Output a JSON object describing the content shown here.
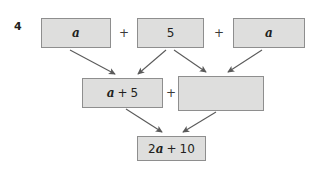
{
  "question": {
    "number": "4"
  },
  "diagram": {
    "type": "expression-pyramid",
    "operators": {
      "top_left": "+",
      "top_right": "+",
      "middle": "+"
    },
    "nodes": [
      {
        "id": "a1",
        "label": "a",
        "parts": [
          {
            "t": "var",
            "v": "a"
          }
        ],
        "row": "top",
        "empty": false
      },
      {
        "id": "5",
        "label": "5",
        "parts": [
          {
            "t": "num",
            "v": "5"
          }
        ],
        "row": "top",
        "empty": false
      },
      {
        "id": "a2",
        "label": "a",
        "parts": [
          {
            "t": "var",
            "v": "a"
          }
        ],
        "row": "top",
        "empty": false
      },
      {
        "id": "a5",
        "label": "a + 5",
        "parts": [
          {
            "t": "var",
            "v": "a"
          },
          {
            "t": "plus",
            "v": "+"
          },
          {
            "t": "num",
            "v": "5"
          }
        ],
        "row": "middle",
        "empty": false
      },
      {
        "id": "blank",
        "label": "",
        "parts": [],
        "row": "middle",
        "empty": true
      },
      {
        "id": "res",
        "label": "2a + 10",
        "parts": [
          {
            "t": "num",
            "v": "2"
          },
          {
            "t": "var",
            "v": "a"
          },
          {
            "t": "plus",
            "v": "+"
          },
          {
            "t": "num",
            "v": "10"
          }
        ],
        "row": "bottom",
        "empty": false
      }
    ],
    "arrows": [
      {
        "from": "a1",
        "to": "a5"
      },
      {
        "from": "5",
        "to": "a5"
      },
      {
        "from": "5",
        "to": "blank"
      },
      {
        "from": "a2",
        "to": "blank"
      },
      {
        "from": "a5",
        "to": "res"
      },
      {
        "from": "blank",
        "to": "res"
      }
    ]
  },
  "colors": {
    "page_background": "#ffffff",
    "box_fill": "#dededd",
    "box_border": "#8e8e8e",
    "text": "#221f20",
    "arrow": "#5a5a5a"
  }
}
